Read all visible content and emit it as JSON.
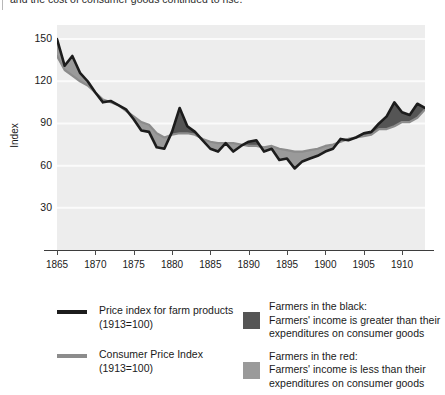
{
  "caption": {
    "text": "and the cost of consumer goods continued to rise."
  },
  "chart_data": {
    "type": "line",
    "title": "",
    "subtitle": "",
    "xlabel": "",
    "ylabel": "Index",
    "xlim": [
      1865,
      1913
    ],
    "ylim": [
      0,
      160
    ],
    "grid": true,
    "grid_axis": "y",
    "legend_position": "below",
    "y_ticks": [
      150,
      120,
      90,
      60,
      30
    ],
    "x_ticks": [
      1865,
      1870,
      1875,
      1880,
      1885,
      1890,
      1895,
      1900,
      1905,
      1910
    ],
    "x": [
      1865,
      1866,
      1867,
      1868,
      1869,
      1870,
      1871,
      1872,
      1873,
      1874,
      1875,
      1876,
      1877,
      1878,
      1879,
      1880,
      1881,
      1882,
      1883,
      1884,
      1885,
      1886,
      1887,
      1888,
      1889,
      1890,
      1891,
      1892,
      1893,
      1894,
      1895,
      1896,
      1897,
      1898,
      1899,
      1900,
      1901,
      1902,
      1903,
      1904,
      1905,
      1906,
      1907,
      1908,
      1909,
      1910,
      1911,
      1912,
      1913
    ],
    "series": [
      {
        "name": "Price index for farm products (1913=100)",
        "color": "#1c1c1c",
        "values": [
          150,
          131,
          138,
          126,
          120,
          112,
          105,
          106,
          103,
          100,
          93,
          85,
          84,
          73,
          72,
          84,
          101,
          88,
          84,
          78,
          72,
          70,
          76,
          70,
          74,
          77,
          78,
          70,
          72,
          64,
          65,
          58,
          63,
          65,
          67,
          70,
          72,
          79,
          78,
          80,
          83,
          84,
          90,
          95,
          105,
          98,
          96,
          104,
          101
        ]
      },
      {
        "name": "Consumer Price Index (1913=100)",
        "color": "#8c8c8c",
        "values": [
          138,
          128,
          124,
          120,
          117,
          112,
          107,
          105,
          103,
          99,
          95,
          91,
          89,
          83,
          80,
          82,
          83,
          83,
          82,
          79,
          77,
          76,
          76,
          76,
          75,
          74,
          74,
          73,
          74,
          72,
          71,
          70,
          70,
          71,
          72,
          74,
          75,
          77,
          79,
          80,
          81,
          82,
          86,
          86,
          88,
          91,
          91,
          94,
          100
        ]
      }
    ],
    "fills": [
      {
        "name": "Farmers in the black",
        "color": "#555555",
        "meaning": "farm product index above consumer price index"
      },
      {
        "name": "Farmers in the red",
        "color": "#9a9a9a",
        "meaning": "farm product index below consumer price index"
      }
    ]
  },
  "legend": {
    "left": [
      {
        "swatch_name": "farm-products-line-swatch",
        "color": "#1c1c1c",
        "line1": "Price index for farm products",
        "line2": "(1913=100)"
      },
      {
        "swatch_name": "cpi-line-swatch",
        "color": "#8c8c8c",
        "line1": "Consumer Price Index",
        "line2": "(1913=100)"
      }
    ],
    "right": [
      {
        "swatch_name": "black-fill-swatch",
        "color": "#555555",
        "line1": "Farmers in the black:",
        "line2": "Farmers' income is greater than their",
        "line3": "expenditures on consumer goods"
      },
      {
        "swatch_name": "red-fill-swatch",
        "color": "#9a9a9a",
        "line1": "Farmers in the red:",
        "line2": "Farmers' income is less than their",
        "line3": "expenditures on consumer goods"
      }
    ]
  }
}
